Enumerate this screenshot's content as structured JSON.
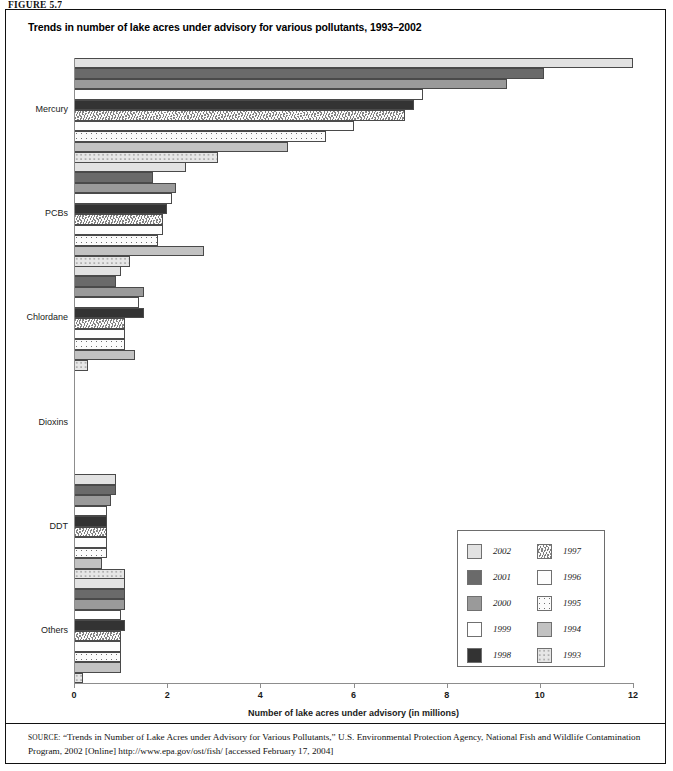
{
  "figure_label": "FIGURE 5.7",
  "chart_title": "Trends in number of lake acres under advisory for various pollutants, 1993–2002",
  "source": {
    "kicker": "source:",
    "text": " “Trends in Number of Lake Acres under Advisory for Various Pollutants,” U.S. Environmental Protection Agency, National Fish and Wildlife Contamination Program, 2002 [Online] http://www.epa.gov/ost/fish/ [accessed February 17, 2004]"
  },
  "legend": {
    "left_column": [
      {
        "year": "2002",
        "swatch": "f2002"
      },
      {
        "year": "2001",
        "swatch": "f2001"
      },
      {
        "year": "2000",
        "swatch": "f2000"
      },
      {
        "year": "1999",
        "swatch": "f1999"
      },
      {
        "year": "1998",
        "swatch": "f1998"
      }
    ],
    "right_column": [
      {
        "year": "1997",
        "swatch": "f1997"
      },
      {
        "year": "1996",
        "swatch": "f1996"
      },
      {
        "year": "1995",
        "swatch": "f1995"
      },
      {
        "year": "1994",
        "swatch": "f1994"
      },
      {
        "year": "1993",
        "swatch": "f1993"
      }
    ]
  },
  "chart_data": {
    "type": "bar",
    "orientation": "horizontal",
    "title": "Trends in number of lake acres under advisory for various pollutants, 1993–2002",
    "xlabel": "Number of lake acres under advisory (in millions)",
    "ylabel": "",
    "xlim": [
      0,
      12
    ],
    "xticks": [
      0,
      2,
      4,
      6,
      8,
      10,
      12
    ],
    "ticklabels": [
      "0",
      "2",
      "4",
      "6",
      "8",
      "10",
      "12"
    ],
    "grid": false,
    "legend_position": "inside-lower-right",
    "categories": [
      "Mercury",
      "PCBs",
      "Chlordane",
      "Dioxins",
      "DDT",
      "Others"
    ],
    "series": [
      {
        "name": "2002",
        "swatch": "f2002",
        "values": [
          12.0,
          2.4,
          1.0,
          0.0,
          0.9,
          1.1
        ]
      },
      {
        "name": "2001",
        "swatch": "f2001",
        "values": [
          10.1,
          1.7,
          0.9,
          0.0,
          0.9,
          1.1
        ]
      },
      {
        "name": "2000",
        "swatch": "f2000",
        "values": [
          9.3,
          2.2,
          1.5,
          0.0,
          0.8,
          1.1
        ]
      },
      {
        "name": "1999",
        "swatch": "f1999",
        "values": [
          7.5,
          2.1,
          1.4,
          0.0,
          0.7,
          1.0
        ]
      },
      {
        "name": "1998",
        "swatch": "f1998",
        "values": [
          7.3,
          2.0,
          1.5,
          0.0,
          0.7,
          1.1
        ]
      },
      {
        "name": "1997",
        "swatch": "f1997",
        "values": [
          7.1,
          1.9,
          1.1,
          0.0,
          0.7,
          1.0
        ]
      },
      {
        "name": "1996",
        "swatch": "f1996",
        "values": [
          6.0,
          1.9,
          1.1,
          0.0,
          0.7,
          1.0
        ]
      },
      {
        "name": "1995",
        "swatch": "f1995",
        "values": [
          5.4,
          1.8,
          1.1,
          0.0,
          0.7,
          1.0
        ]
      },
      {
        "name": "1994",
        "swatch": "f1994",
        "values": [
          4.6,
          2.8,
          1.3,
          0.0,
          0.6,
          1.0
        ]
      },
      {
        "name": "1993",
        "swatch": "f1993",
        "values": [
          3.1,
          1.2,
          0.3,
          0.0,
          1.1,
          0.2
        ]
      }
    ]
  }
}
